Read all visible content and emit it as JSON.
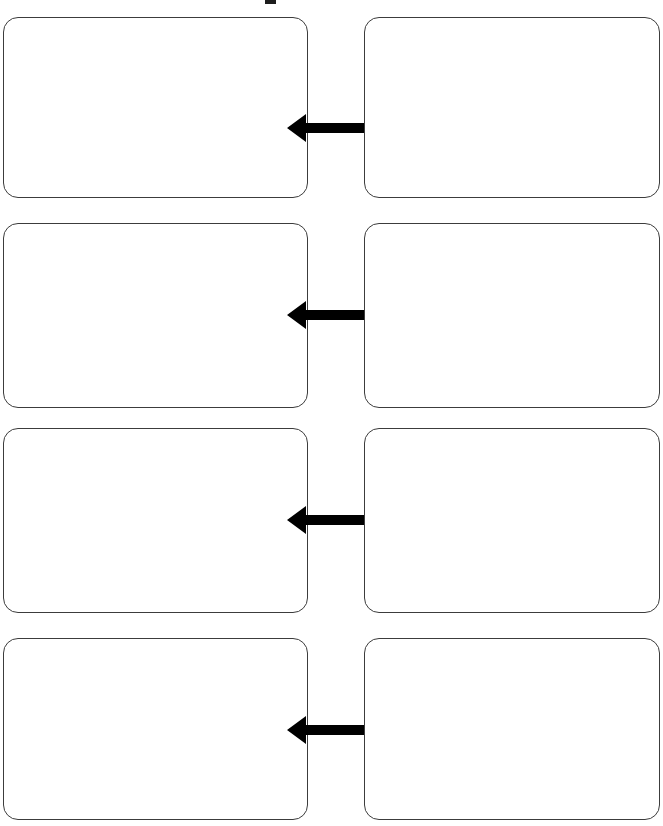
{
  "document": {
    "title": "Comparison Graphic Organizer",
    "background_color": "#ffffff",
    "width": 663,
    "height": 826,
    "top_artifact": {
      "name": "clipped-text-mark",
      "description": "small clipped black mark at top center",
      "color": "#1d1d1d"
    }
  },
  "style": {
    "box_border_color": "#3c3c3c",
    "box_fill_color": "#ffffff",
    "box_border_radius": "15px",
    "arrow_color": "#000000"
  },
  "rows": [
    {
      "index": 1,
      "top": 17,
      "height": 181,
      "arrow_center_y": 111,
      "arrow": {
        "label": "",
        "icon": "double-arrow-horizontal-icon"
      },
      "left_box": {
        "text": ""
      },
      "right_box": {
        "text": ""
      }
    },
    {
      "index": 2,
      "top": 223,
      "height": 185,
      "arrow_center_y": 315,
      "arrow": {
        "label": "",
        "icon": "double-arrow-horizontal-icon"
      },
      "left_box": {
        "text": ""
      },
      "right_box": {
        "text": ""
      }
    },
    {
      "index": 3,
      "top": 428,
      "height": 185,
      "arrow_center_y": 520,
      "arrow": {
        "label": "",
        "icon": "double-arrow-horizontal-icon"
      },
      "left_box": {
        "text": ""
      },
      "right_box": {
        "text": ""
      }
    },
    {
      "index": 4,
      "top": 638,
      "height": 182,
      "arrow_center_y": 730,
      "arrow": {
        "label": "",
        "icon": "double-arrow-horizontal-icon"
      },
      "left_box": {
        "text": ""
      },
      "right_box": {
        "text": ""
      }
    }
  ]
}
